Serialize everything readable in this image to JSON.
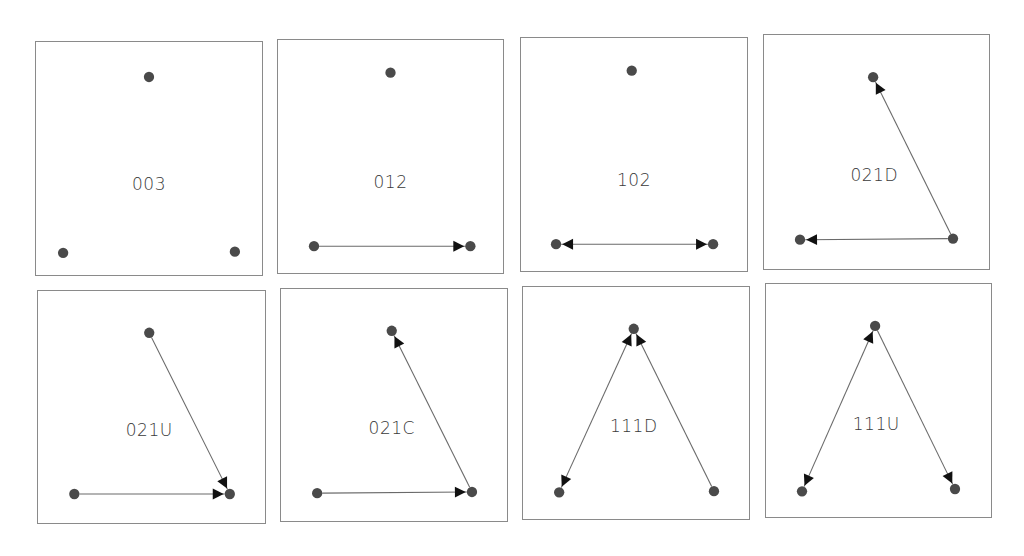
{
  "diagram": {
    "node_color": "#4a4a4a",
    "edge_color": "#6a6a6a",
    "arrow_color": "#111111",
    "panels": [
      {
        "id": "003",
        "label": "003",
        "box": {
          "x": 35,
          "y": 41,
          "w": 228,
          "h": 235
        },
        "label_pos": {
          "x": 0.5,
          "y": 0.61
        },
        "nodes": {
          "top": [
            0.5,
            0.15
          ],
          "left": [
            0.12,
            0.905
          ],
          "right": [
            0.88,
            0.9
          ]
        },
        "edges": []
      },
      {
        "id": "012",
        "label": "012",
        "box": {
          "x": 277,
          "y": 39,
          "w": 227,
          "h": 235
        },
        "label_pos": {
          "x": 0.5,
          "y": 0.61
        },
        "nodes": {
          "top": [
            0.5,
            0.14
          ],
          "left": [
            0.16,
            0.885
          ],
          "right": [
            0.855,
            0.885
          ]
        },
        "edges": [
          {
            "from": "left",
            "to": "right",
            "arrow_end": true,
            "arrow_start": false
          }
        ]
      },
      {
        "id": "102",
        "label": "102",
        "box": {
          "x": 520,
          "y": 37,
          "w": 228,
          "h": 235
        },
        "label_pos": {
          "x": 0.5,
          "y": 0.61
        },
        "nodes": {
          "top": [
            0.49,
            0.14
          ],
          "left": [
            0.155,
            0.885
          ],
          "right": [
            0.85,
            0.885
          ]
        },
        "edges": [
          {
            "from": "left",
            "to": "right",
            "arrow_end": true,
            "arrow_start": true
          }
        ]
      },
      {
        "id": "021D",
        "label": "021D",
        "box": {
          "x": 763,
          "y": 34,
          "w": 227,
          "h": 236
        },
        "label_pos": {
          "x": 0.49,
          "y": 0.6
        },
        "nodes": {
          "top": [
            0.485,
            0.18
          ],
          "left": [
            0.16,
            0.875
          ],
          "right": [
            0.84,
            0.87
          ]
        },
        "edges": [
          {
            "from": "right",
            "to": "top",
            "arrow_end": true,
            "arrow_start": false
          },
          {
            "from": "right",
            "to": "left",
            "arrow_end": true,
            "arrow_start": false
          }
        ]
      },
      {
        "id": "021U",
        "label": "021U",
        "box": {
          "x": 37,
          "y": 290,
          "w": 229,
          "h": 234
        },
        "label_pos": {
          "x": 0.49,
          "y": 0.6
        },
        "nodes": {
          "top": [
            0.49,
            0.18
          ],
          "left": [
            0.16,
            0.875
          ],
          "right": [
            0.845,
            0.875
          ]
        },
        "edges": [
          {
            "from": "top",
            "to": "right",
            "arrow_end": true,
            "arrow_start": false
          },
          {
            "from": "left",
            "to": "right",
            "arrow_end": true,
            "arrow_start": false
          }
        ]
      },
      {
        "id": "021C",
        "label": "021C",
        "box": {
          "x": 280,
          "y": 288,
          "w": 228,
          "h": 234
        },
        "label_pos": {
          "x": 0.49,
          "y": 0.6
        },
        "nodes": {
          "top": [
            0.49,
            0.18
          ],
          "left": [
            0.16,
            0.88
          ],
          "right": [
            0.845,
            0.875
          ]
        },
        "edges": [
          {
            "from": "left",
            "to": "right",
            "arrow_end": true,
            "arrow_start": false
          },
          {
            "from": "right",
            "to": "top",
            "arrow_end": true,
            "arrow_start": false
          }
        ]
      },
      {
        "id": "111D",
        "label": "111D",
        "box": {
          "x": 522,
          "y": 286,
          "w": 228,
          "h": 234
        },
        "label_pos": {
          "x": 0.49,
          "y": 0.6
        },
        "nodes": {
          "top": [
            0.49,
            0.18
          ],
          "left": [
            0.16,
            0.885
          ],
          "right": [
            0.845,
            0.88
          ]
        },
        "edges": [
          {
            "from": "top",
            "to": "left",
            "arrow_end": true,
            "arrow_start": true
          },
          {
            "from": "right",
            "to": "top",
            "arrow_end": true,
            "arrow_start": false
          }
        ]
      },
      {
        "id": "111U",
        "label": "111U",
        "box": {
          "x": 765,
          "y": 283,
          "w": 227,
          "h": 235
        },
        "label_pos": {
          "x": 0.49,
          "y": 0.6
        },
        "nodes": {
          "top": [
            0.485,
            0.18
          ],
          "left": [
            0.16,
            0.89
          ],
          "right": [
            0.84,
            0.88
          ]
        },
        "edges": [
          {
            "from": "top",
            "to": "left",
            "arrow_end": true,
            "arrow_start": true
          },
          {
            "from": "top",
            "to": "right",
            "arrow_end": true,
            "arrow_start": false
          }
        ]
      }
    ]
  }
}
